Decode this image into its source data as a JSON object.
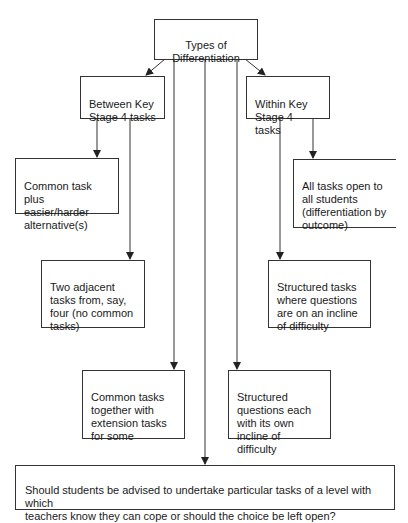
{
  "diagram": {
    "root": {
      "label": "Types of\nDifferentiation"
    },
    "branches": {
      "between": {
        "label": "Between Key\nStage 4 tasks"
      },
      "within": {
        "label": "Within Key\nStage 4 tasks"
      }
    },
    "leaves": {
      "common_task_alternatives": {
        "label": "Common task\nplus easier/harder\nalternative(s)"
      },
      "two_adjacent_tasks": {
        "label": "Two adjacent\ntasks from, say,\nfour (no common\ntasks)"
      },
      "all_tasks_open": {
        "label": "All tasks open to\nall students\n(differentiation by\noutcome)"
      },
      "structured_tasks_incline": {
        "label": "Structured tasks\nwhere questions\nare on an incline\nof difficulty"
      },
      "common_tasks_extension": {
        "label": "Common tasks\ntogether with\nextension tasks\nfor some"
      },
      "structured_questions_each": {
        "label": "Structured\nquestions each\nwith its own\nincline of difficulty"
      }
    },
    "question": {
      "label": "Should students be advised to undertake particular tasks of a level with which\nteachers know they can cope or should the choice be left open?"
    },
    "colors": {
      "line": "#333333",
      "background": "#ffffff",
      "text": "#1a1a1a"
    }
  }
}
